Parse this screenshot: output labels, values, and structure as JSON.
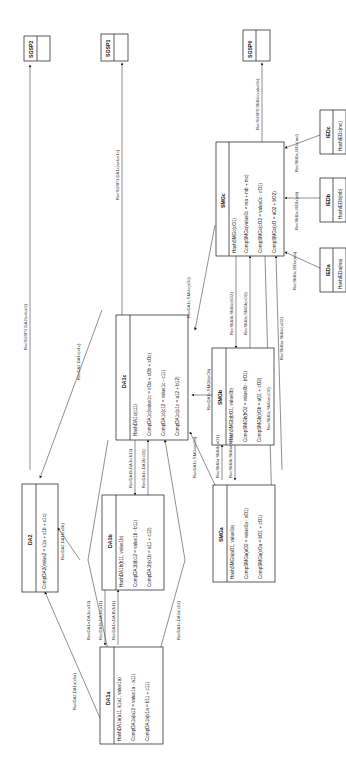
{
  "diagram": {
    "orientation": "rotated-90-ccw",
    "nodes": {
      "sgsp2": {
        "title": "SGSP2",
        "rows": []
      },
      "sgsp1": {
        "title": "SGSP1",
        "rows": []
      },
      "sgsp0": {
        "title": "SGSP0",
        "rows": []
      },
      "smg_c": {
        "title": "SMGc",
        "rows": [
          "HashSMGc(cO1)",
          "CompSMGc(value0c = ma + mb + mc)",
          "CompSMGc(cO2 = value0c - cO1)",
          "CompSMGc(xO = aO2 + bO2)"
        ]
      },
      "ied_c": {
        "title": "IEDc",
        "rows": [
          "HashIEDc(mc)"
        ]
      },
      "ied_b": {
        "title": "IEDb",
        "rows": [
          "HashIEDb(mb)"
        ]
      },
      "ied_a": {
        "title": "IEDa",
        "rows": [
          "HashIEDa(ma)"
        ]
      },
      "da1_c": {
        "title": "DA1c",
        "rows": [
          "HashDA1c(c11)",
          "CompDA1c(value1c = xOa + xOb + xOc)",
          "CompDA1c(c12 = value1c - c11)",
          "CompDA1c(x1c = a12 + b12)"
        ]
      },
      "smg_b": {
        "title": "SMGb",
        "rows": [
          "HashSMGb(bO1, value0b)",
          "CompSMGb(bO2 = value0b - bO1)",
          "CompSMGb(xOb = aO1 + cO2)"
        ]
      },
      "smg_a": {
        "title": "SMGa",
        "rows": [
          "HashSMGa(aO1, value0a)",
          "CompSMGa(aO2 = value0a - aO1)",
          "CompSMGa(xOa = bO1 + cO1)"
        ]
      },
      "da2": {
        "title": "DA2",
        "rows": [
          "CompDA2(value2 = x1a + x1b + x1c)"
        ]
      },
      "da1_b": {
        "title": "DA1b",
        "rows": [
          "HashDA1b(b11, value1b)",
          "CompDA1b(b12 = value1b - b11)",
          "CompDA1b(x1b = a11 + c12)"
        ]
      },
      "da1_a": {
        "title": "DA1a",
        "rows": [
          "HashDA1a(a11, k1a1, value1a)",
          "CompDA1a(a12 = value1a - a11)",
          "CompDA1a(x1a = b11 + c11)"
        ]
      }
    },
    "edges": {
      "sgsp2_da2": "RecSGSP2,DA2(value2)",
      "sgsp1_da1c": "RecSGSP1,DA1c(value1c)",
      "sgsp0_smgc": "RecSGSP0,SMGc(value0c)",
      "smgc_iedc": "RecSMGc,IEDc(mc)",
      "smgc_iedb": "RecSMGc,IEDb(mb)",
      "smgc_ieda": "RecSMGc,IEDa(ma)",
      "da1c_smgc": "RecDA1c,SMGc(xOc)",
      "smgb_smgc": "RecSMGb,SMGc(bO2)",
      "smga_smgc": "RecSMGa,SMGc(aO2)",
      "smgc_smgb": "RecSMGc,SMGb(cO1)",
      "da1c_smgb": "RecDA1c,SMGb(xOb)",
      "smgc_smga": "RecSMGc,SMGa(cO2)",
      "smga_smgb": "RecSMGa,SMGb(aO1)",
      "smgb_smga": "RecSMGb,SMGa(bO1)",
      "da1c_smga": "RecDA1c,SMGa(xOa)",
      "da2_da1c": "RecDA2,DA1c(x1c)",
      "da2_da1b": "RecDA2,DA1b(x1b)",
      "da1b_da1c": "RecDA1b,DA1c(b12)",
      "da1c_da1b": "RecDA1c,DA1b(c11)",
      "da1a_da1c": "RecDA1a,DA1c(a12)",
      "da1c_da1a": "RecDA1c,DA1a(c12)",
      "da1a_da1b": "RecDA1a,DA1b(b11)",
      "da1b_da1a": "RecDA1b,DA1a(a11)",
      "da2_da1a": "RecDA2,DA1a(x1a)"
    }
  }
}
